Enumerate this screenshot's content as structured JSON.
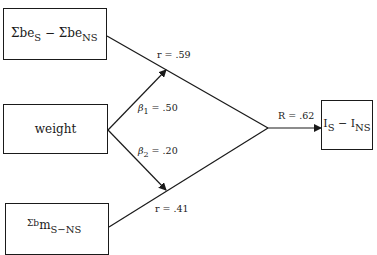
{
  "diagram": {
    "nodes": {
      "be_diff": {
        "main1": "Σbe",
        "sub1": "S",
        "op": " − ",
        "main2": "Σbe",
        "sub2": "NS"
      },
      "weight": {
        "label": "weight"
      },
      "bm_diff": {
        "main": "Σb",
        "main2": "m",
        "sub": "S−NS"
      },
      "outcome": {
        "main1": "I",
        "sub1": "S",
        "op": " − ",
        "main2": "I",
        "sub2": "NS"
      }
    },
    "edges": {
      "r1": {
        "prefix": "r = ",
        "value": ".59"
      },
      "beta1": {
        "symbol": "β",
        "sub": "1",
        "eq": " = ",
        "value": ".50"
      },
      "beta2": {
        "symbol": "β",
        "sub": "2",
        "eq": " = ",
        "value": ".20"
      },
      "r2": {
        "prefix": "r = ",
        "value": ".41"
      },
      "R": {
        "prefix": "R = ",
        "value": ".62"
      }
    },
    "colors": {
      "line": "#1a1a1a",
      "background": "#ffffff"
    }
  }
}
